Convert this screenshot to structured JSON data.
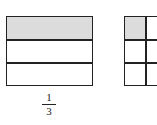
{
  "left_model": {
    "rows": 3,
    "shaded_rows": [
      0
    ],
    "label_numerator": "1",
    "label_denominator": "3"
  },
  "right_model": {
    "rows": 3,
    "columns_visible": 2,
    "shaded_cells": [
      [
        0,
        0
      ]
    ]
  },
  "colors": {
    "shade": "#dcdcdc",
    "line": "#222222"
  }
}
